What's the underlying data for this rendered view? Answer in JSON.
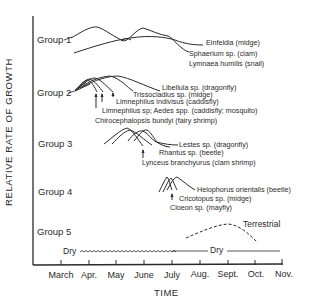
{
  "axes": {
    "ylabel": "RELATIVE RATE OF GROWTH",
    "xlabel": "TIME",
    "months": [
      "March",
      "Apr.",
      "May",
      "June",
      "July",
      "Aug.",
      "Sept.",
      "Oct.",
      "Nov."
    ]
  },
  "groups": [
    {
      "label": "Group 1",
      "species": [
        "Einfeldia (midge)",
        "Sphaerium sp. (clam)",
        "Lymnaea humilis (snail)"
      ]
    },
    {
      "label": "Group 2",
      "species": [
        "Libellula sp. (dragonfly)",
        "Trissocladius sp. (midge)",
        "Limnephilus indivisus (caddisfly)",
        "Limnephilus sp; Aedes spp. (caddisfly; mosquito)",
        "Chirocephalopsis bundyi (fairy shrimp)"
      ]
    },
    {
      "label": "Group 3",
      "species": [
        "Lestes sp. (dragonfly)",
        "Rhantus sp. (beetle)",
        "Lynceus  branchyurus (clam shrimp)"
      ]
    },
    {
      "label": "Group 4",
      "species": [
        "Helophorus orientalis (beetle)",
        "Cricotopus sp. (midge)",
        "Cloeon sp. (mayfly)"
      ]
    },
    {
      "label": "Group 5",
      "species": [
        "Terrestrial"
      ]
    }
  ],
  "dry_labels": [
    "Dry",
    "Dry"
  ],
  "colors": {
    "ink": "#2a2a2a",
    "background": "#ffffff"
  }
}
